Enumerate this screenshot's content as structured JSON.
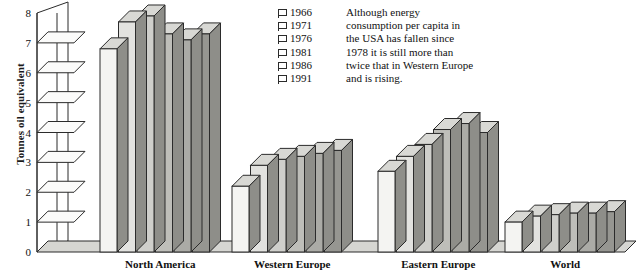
{
  "chart_data": {
    "type": "bar",
    "title": "",
    "xlabel": "",
    "ylabel": "Tonnes oil equivalent",
    "ylim": [
      0,
      8
    ],
    "yticks": [
      0,
      1,
      2,
      3,
      4,
      5,
      6,
      7,
      8
    ],
    "grid": false,
    "legend_position": "top-center",
    "categories": [
      "North America",
      "Western Europe",
      "Eastern Europe",
      "World"
    ],
    "series": [
      {
        "name": "1966",
        "values": [
          6.8,
          2.2,
          2.7,
          1.0
        ]
      },
      {
        "name": "1971",
        "values": [
          7.7,
          2.9,
          3.2,
          1.2
        ]
      },
      {
        "name": "1976",
        "values": [
          7.9,
          3.1,
          3.6,
          1.25
        ]
      },
      {
        "name": "1981",
        "values": [
          7.3,
          3.2,
          4.1,
          1.3
        ]
      },
      {
        "name": "1986",
        "values": [
          7.1,
          3.3,
          4.3,
          1.3
        ]
      },
      {
        "name": "1991",
        "values": [
          7.3,
          3.4,
          4.0,
          1.35
        ]
      }
    ],
    "series_colors": [
      "#f4f4f2",
      "#e2e2df",
      "#cfcfcb",
      "#bebeb9",
      "#ababa6",
      "#969691"
    ]
  },
  "axis": {
    "tick_labels": [
      "8",
      "7",
      "6",
      "5",
      "4",
      "3",
      "2",
      "1",
      "0"
    ],
    "title": "Tonnes oil equivalent"
  },
  "legend": {
    "entries": [
      {
        "label": "1966"
      },
      {
        "label": "1971"
      },
      {
        "label": "1976"
      },
      {
        "label": "1981"
      },
      {
        "label": "1986"
      },
      {
        "label": "1991"
      }
    ],
    "note_lines": [
      "Although energy",
      "consumption per capita in",
      "the USA has fallen since",
      "1978 it is still more than",
      "twice that in Western Europe",
      "and is rising."
    ]
  },
  "category_labels": [
    {
      "text": "North America"
    },
    {
      "text": "Western Europe"
    },
    {
      "text": "Eastern Europe"
    },
    {
      "text": "World"
    }
  ],
  "colors": {
    "outline": "#2b2b2b",
    "top_face": "#d8d8d4",
    "side_face": "#8e8e89",
    "floor": "#d6d6d2",
    "background": "#ffffff"
  }
}
